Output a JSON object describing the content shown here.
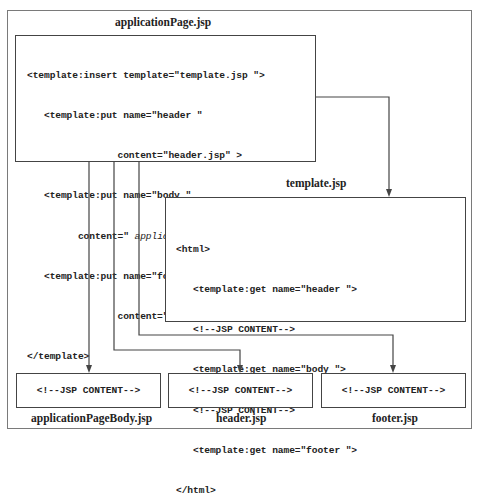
{
  "diagram": {
    "application_page": {
      "title": "applicationPage.jsp",
      "lines": [
        {
          "text": "<template:insert template=\"template.jsp \">"
        },
        {
          "text": "   <template:put name=\"header \""
        },
        {
          "text": "                content=\"header.jsp\" >"
        },
        {
          "text": "   <template:put name=\"body \""
        },
        {
          "pre": "         content=\" ",
          "italic": "applicationPageBody.jsp",
          "post": " \">"
        },
        {
          "text": "   <template:put name=\"footer \""
        },
        {
          "pre": "                content=\" ",
          "italic": "footer.jsp",
          "post": "\">"
        },
        {
          "text": "</template>"
        }
      ]
    },
    "template": {
      "title": "template.jsp",
      "lines": [
        "<html>",
        "   <template:get name=\"header \">",
        "   <!--JSP CONTENT-->",
        "   <template:get name=\"body \">",
        "   <!--JSP CONTENT-->",
        "   <template:get name=\"footer \">",
        "</html>"
      ]
    },
    "targets": [
      {
        "title": "applicationPageBody.jsp",
        "content": "<!--JSP CONTENT-->"
      },
      {
        "title": "header.jsp",
        "content": "<!--JSP CONTENT-->"
      },
      {
        "title": "footer.jsp",
        "content": "<!--JSP CONTENT-->"
      }
    ],
    "colors": {
      "line": "#444444",
      "outer_border": "#7a7a7a",
      "text": "#222222"
    }
  }
}
